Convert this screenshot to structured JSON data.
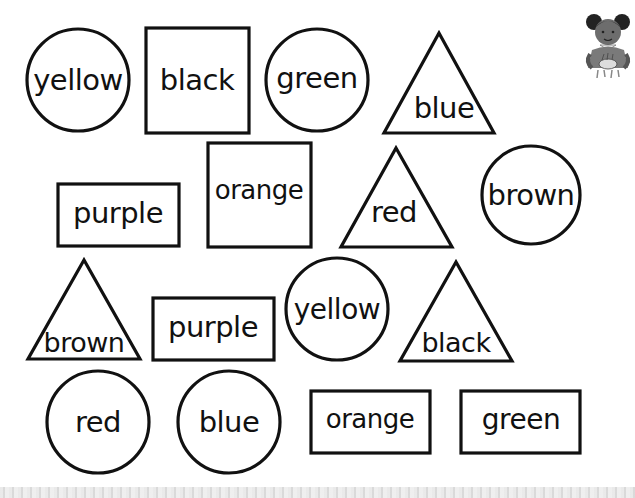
{
  "worksheet": {
    "title": "Color words in shapes",
    "shapes": [
      {
        "type": "circle",
        "label": "yellow",
        "cx": 78,
        "cy": 80,
        "r": 51
      },
      {
        "type": "rect",
        "label": "black",
        "x": 146,
        "y": 28,
        "w": 103,
        "h": 105
      },
      {
        "type": "circle",
        "label": "green",
        "cx": 317,
        "cy": 80,
        "r": 51
      },
      {
        "type": "triangle",
        "label": "blue",
        "points": "439,33 384,133 494,133",
        "tx": 444,
        "ty": 110
      },
      {
        "type": "rect",
        "label": "purple",
        "x": 58,
        "y": 184,
        "w": 121,
        "h": 62
      },
      {
        "type": "rect",
        "label": "orange",
        "x": 208,
        "y": 143,
        "w": 103,
        "h": 104
      },
      {
        "type": "triangle",
        "label": "red",
        "points": "396,148 341,247 452,247",
        "tx": 394,
        "ty": 213
      },
      {
        "type": "circle",
        "label": "brown",
        "cx": 531,
        "cy": 195,
        "r": 49
      },
      {
        "type": "triangle",
        "label": "brown",
        "points": "84,260 28,359 140,359",
        "tx": 84,
        "ty": 343
      },
      {
        "type": "rect",
        "label": "purple",
        "x": 153,
        "y": 298,
        "w": 121,
        "h": 62
      },
      {
        "type": "circle",
        "label": "yellow",
        "cx": 337,
        "cy": 309,
        "r": 51
      },
      {
        "type": "triangle",
        "label": "black",
        "points": "456,262 400,361 512,361",
        "tx": 456,
        "ty": 343
      },
      {
        "type": "circle",
        "label": "red",
        "cx": 98,
        "cy": 422,
        "r": 51
      },
      {
        "type": "circle",
        "label": "blue",
        "cx": 229,
        "cy": 422,
        "r": 51
      },
      {
        "type": "rect",
        "label": "orange",
        "x": 311,
        "y": 391,
        "w": 119,
        "h": 62
      },
      {
        "type": "rect",
        "label": "green",
        "x": 461,
        "y": 391,
        "w": 119,
        "h": 62
      }
    ],
    "illustration": {
      "name": "girl-with-bowl",
      "description": "cartoon girl holding a bowl"
    }
  },
  "colors": {
    "ink": "#111111",
    "paper": "#ffffff"
  }
}
